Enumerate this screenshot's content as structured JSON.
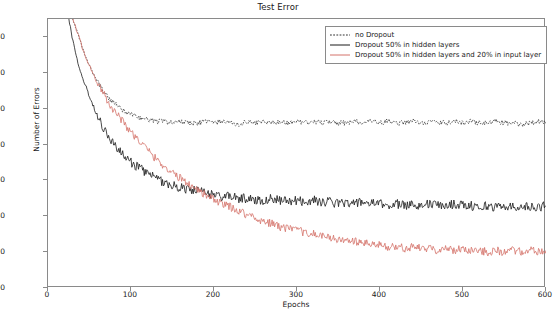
{
  "chart_data": {
    "type": "line",
    "title": "Test Error",
    "xlabel": "Epochs",
    "ylabel": "Number of Errors",
    "xlim": [
      0,
      600
    ],
    "ylim": [
      100,
      250
    ],
    "xticks": [
      0,
      100,
      200,
      300,
      400,
      500,
      600
    ],
    "yticks": [
      100,
      120,
      140,
      160,
      180,
      200,
      220,
      240
    ],
    "grid": false,
    "legend_position": "upper right",
    "colors": {
      "no_dropout": "#1a1a1a",
      "hidden_dropout": "#1a1a1a",
      "input_dropout": "#d4726a"
    },
    "series": [
      {
        "name": "no Dropout",
        "style": "dotted",
        "color": "#1a1a1a",
        "x": [
          20,
          25,
          30,
          35,
          40,
          45,
          50,
          55,
          60,
          65,
          70,
          75,
          80,
          85,
          90,
          95,
          100,
          110,
          120,
          130,
          140,
          150,
          160,
          170,
          180,
          190,
          200,
          210,
          220,
          230,
          240,
          250,
          260,
          270,
          280,
          290,
          300,
          310,
          320,
          330,
          340,
          350,
          360,
          370,
          380,
          390,
          400,
          410,
          420,
          430,
          440,
          450,
          460,
          470,
          480,
          490,
          500,
          510,
          520,
          530,
          540,
          550,
          560,
          570,
          580,
          590,
          600
        ],
        "values": [
          266,
          258,
          249,
          243,
          236,
          229,
          224,
          219,
          215,
          211,
          208,
          205,
          203,
          201,
          199,
          198,
          197,
          195,
          194,
          193,
          193,
          192,
          193,
          192,
          192,
          193,
          192,
          193,
          192,
          191,
          193,
          192,
          193,
          192,
          193,
          192,
          193,
          192,
          193,
          192,
          193,
          192,
          192,
          193,
          192,
          193,
          192,
          193,
          192,
          192,
          193,
          192,
          193,
          192,
          192,
          193,
          192,
          193,
          192,
          192,
          193,
          192,
          192,
          191,
          192,
          193,
          192
        ]
      },
      {
        "name": "Dropout 50% in hidden layers",
        "style": "solid",
        "color": "#1a1a1a",
        "x": [
          20,
          25,
          30,
          35,
          40,
          45,
          50,
          55,
          60,
          65,
          70,
          75,
          80,
          85,
          90,
          95,
          100,
          110,
          120,
          130,
          140,
          150,
          160,
          170,
          180,
          190,
          200,
          210,
          220,
          230,
          240,
          250,
          260,
          270,
          280,
          290,
          300,
          310,
          320,
          330,
          340,
          350,
          360,
          370,
          380,
          390,
          400,
          410,
          420,
          430,
          440,
          450,
          460,
          470,
          480,
          490,
          500,
          510,
          520,
          530,
          540,
          550,
          560,
          570,
          580,
          590,
          600
        ],
        "values": [
          262,
          250,
          238,
          228,
          220,
          213,
          207,
          201,
          196,
          191,
          187,
          183,
          180,
          177,
          174,
          172,
          170,
          167,
          164,
          161,
          159,
          157,
          156,
          155,
          154,
          153,
          152,
          151,
          151,
          150,
          150,
          149,
          149,
          150,
          149,
          148,
          149,
          148,
          149,
          148,
          148,
          147,
          148,
          147,
          148,
          147,
          147,
          146,
          147,
          146,
          147,
          146,
          147,
          146,
          146,
          147,
          146,
          146,
          145,
          146,
          145,
          146,
          145,
          146,
          145,
          145,
          146
        ]
      },
      {
        "name": "Dropout 50% in hidden layers and 20% in input layer",
        "style": "solid",
        "color": "#d4726a",
        "x": [
          20,
          25,
          30,
          35,
          40,
          45,
          50,
          55,
          60,
          65,
          70,
          75,
          80,
          85,
          90,
          95,
          100,
          110,
          120,
          130,
          140,
          150,
          160,
          170,
          180,
          190,
          200,
          210,
          220,
          230,
          240,
          250,
          260,
          270,
          280,
          290,
          300,
          310,
          320,
          330,
          340,
          350,
          360,
          370,
          380,
          390,
          400,
          410,
          420,
          430,
          440,
          450,
          460,
          470,
          480,
          490,
          500,
          510,
          520,
          530,
          540,
          550,
          560,
          570,
          580,
          590,
          600
        ],
        "values": [
          268,
          259,
          250,
          243,
          236,
          229,
          224,
          219,
          214,
          210,
          206,
          202,
          199,
          196,
          193,
          190,
          187,
          182,
          177,
          172,
          168,
          164,
          161,
          158,
          155,
          152,
          149,
          147,
          145,
          143,
          141,
          139,
          137,
          136,
          134,
          133,
          132,
          131,
          130,
          129,
          128,
          127,
          126,
          126,
          125,
          124,
          124,
          123,
          123,
          122,
          123,
          122,
          122,
          121,
          122,
          121,
          122,
          121,
          121,
          120,
          121,
          120,
          121,
          120,
          121,
          120,
          121
        ]
      }
    ]
  }
}
